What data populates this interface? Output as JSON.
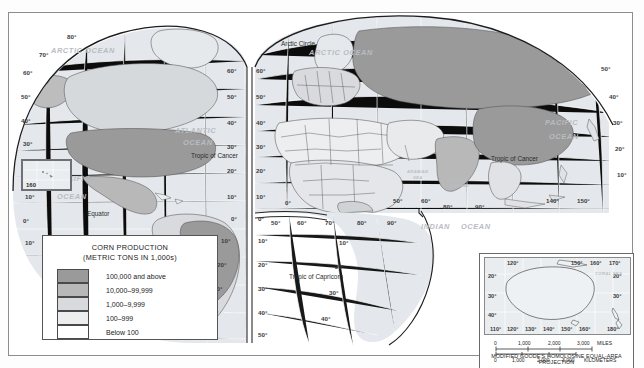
{
  "map": {
    "title": "World Corn Production",
    "projection_note": "MODIFIED GOODE'S HOMOLOSINE EQUAL-AREA PROJECTION",
    "ocean_labels": [
      {
        "text": "ARCTIC OCEAN",
        "x": 72,
        "y": 40
      },
      {
        "text": "ARCTIC OCEAN",
        "x": 320,
        "y": 42
      },
      {
        "text": "ATLANTIC",
        "x": 190,
        "y": 120
      },
      {
        "text": "OCEAN",
        "x": 196,
        "y": 131
      },
      {
        "text": "PACIFIC",
        "x": 64,
        "y": 168
      },
      {
        "text": "OCEAN",
        "x": 64,
        "y": 186
      },
      {
        "text": "PACIFIC",
        "x": 553,
        "y": 112
      },
      {
        "text": "OCEAN",
        "x": 556,
        "y": 126
      },
      {
        "text": "INDIAN",
        "x": 432,
        "y": 216
      },
      {
        "text": "OCEAN",
        "x": 470,
        "y": 216
      }
    ],
    "sea_labels": [
      {
        "text": "ARABIAN",
        "x": 409,
        "y": 160
      },
      {
        "text": "SEA",
        "x": 414,
        "y": 166
      },
      {
        "text": "BAY OF",
        "x": 452,
        "y": 168
      },
      {
        "text": "BENGAL",
        "x": 452,
        "y": 174
      },
      {
        "text": "CORAL SEA",
        "x": 588,
        "y": 253
      }
    ],
    "line_labels": [
      {
        "text": "Arctic Circle",
        "x": 296,
        "y": 31
      },
      {
        "text": "Tropic of Cancer",
        "x": 240,
        "y": 143
      },
      {
        "text": "Tropic of Cancer",
        "x": 497,
        "y": 146
      },
      {
        "text": "Equator",
        "x": 88,
        "y": 203
      },
      {
        "text": "Tropic of Capricorn",
        "x": 337,
        "y": 264
      }
    ],
    "latitude_labels_left": [
      "80",
      "70",
      "60",
      "50",
      "40",
      "30",
      "20",
      "10",
      "0",
      "10"
    ],
    "latitude_labels_center": [
      "60",
      "50",
      "40",
      "30",
      "20",
      "10",
      "0",
      "10",
      "20",
      "30",
      "40",
      "50"
    ],
    "latitude_labels_right": [
      "60",
      "50",
      "40",
      "30",
      "20",
      "10",
      "0",
      "10",
      "20",
      "30",
      "40"
    ],
    "longitude_labels_africa": [
      "0",
      "50",
      "60"
    ],
    "longitude_labels_asia": [
      "80",
      "90",
      "140",
      "150"
    ],
    "longitude_labels_indian": [
      "50",
      "60",
      "70",
      "80",
      "90"
    ],
    "hawaii_inset_label": "160"
  },
  "legend": {
    "title_line1": "CORN PRODUCTION",
    "title_line2": "(METRIC TONS IN 1,000s)",
    "classes": [
      {
        "label": "100,000 and above",
        "color": "#9a9a9a"
      },
      {
        "label": "10,000–99,999",
        "color": "#b8b8b8"
      },
      {
        "label": "1,000–9,999",
        "color": "#d8dade"
      },
      {
        "label": "100–999",
        "color": "#ebedef"
      },
      {
        "label": "Below 100",
        "color": "#ffffff"
      }
    ]
  },
  "inset": {
    "name": "Australia and New Zealand",
    "lon_labels_top": [
      {
        "text": "120",
        "x": 30
      },
      {
        "text": "150",
        "x": 88
      },
      {
        "text": "160",
        "x": 108
      },
      {
        "text": "170",
        "x": 128
      }
    ],
    "lon_labels_bottom": [
      {
        "text": "110",
        "x": 12
      },
      {
        "text": "120",
        "x": 30
      },
      {
        "text": "130",
        "x": 48
      },
      {
        "text": "140",
        "x": 66
      },
      {
        "text": "150",
        "x": 84
      },
      {
        "text": "160",
        "x": 102
      },
      {
        "text": "180",
        "x": 130
      }
    ],
    "lat_labels_left": [
      {
        "text": "20",
        "y": 26
      },
      {
        "text": "30",
        "y": 45
      },
      {
        "text": "40",
        "y": 63
      }
    ],
    "lat_labels_right": [
      {
        "text": "20",
        "y": 26
      },
      {
        "text": "30",
        "y": 45
      }
    ]
  },
  "scales": {
    "miles": {
      "ticks": [
        "0",
        "1,000",
        "2,000",
        "3,000"
      ],
      "unit": "MILES"
    },
    "kilometers": {
      "ticks": [
        "0",
        "1,000",
        "2,000",
        "3,000"
      ],
      "unit": "KILOMETERS"
    }
  }
}
